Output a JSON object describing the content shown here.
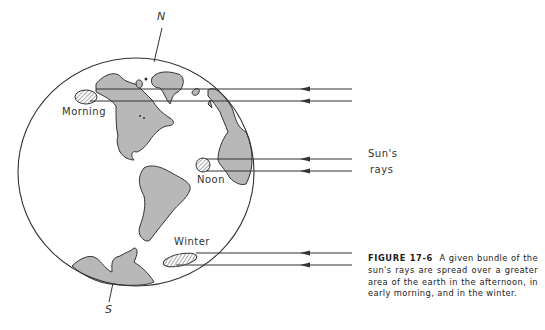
{
  "figure": {
    "number": "FIGURE 17-6",
    "caption": "A given bundle of the sun's rays are spread over a greater area of the earth in the afternoon, in early morning, and in the winter."
  },
  "labels": {
    "north": "N",
    "south": "S",
    "morning": "Morning",
    "noon": "Noon",
    "winter": "Winter",
    "suns_rays_line1": "Sun's",
    "suns_rays_line2": "rays"
  },
  "colors": {
    "land": "#b8b8b8",
    "outline": "#333333",
    "background": "#ffffff"
  }
}
